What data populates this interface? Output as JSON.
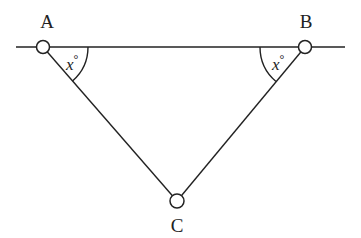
{
  "diagram": {
    "type": "geometry",
    "colors": {
      "stroke": "#222222",
      "background": "#ffffff"
    },
    "line": {
      "x1": 16,
      "y1": 47,
      "x2": 345,
      "y2": 47
    },
    "points": {
      "A": {
        "label": "A",
        "x": 43,
        "y": 47
      },
      "B": {
        "label": "B",
        "x": 305,
        "y": 47
      },
      "C": {
        "label": "C",
        "x": 177,
        "y": 201
      }
    },
    "angles": {
      "A": {
        "label": "x",
        "unit": "°"
      },
      "B": {
        "label": "x",
        "unit": "°"
      }
    }
  }
}
